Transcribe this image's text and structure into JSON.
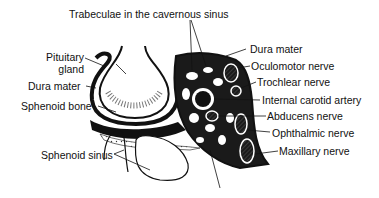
{
  "diagram": {
    "labels": {
      "trabeculae": "Trabeculae in the cavernous sinus",
      "pituitary_line1": "Pituitary",
      "pituitary_line2": "gland",
      "dura_left": "Dura mater",
      "sphenoid_bone": "Sphenoid bone",
      "sphenoid_sinus": "Sphenoid sinus",
      "dura_right": "Dura mater",
      "oculomotor": "Oculomotor nerve",
      "trochlear": "Trochlear nerve",
      "carotid": "Internal carotid artery",
      "abducens": "Abducens nerve",
      "ophthalmic": "Ophthalmic nerve",
      "maxillary": "Maxillary nerve"
    },
    "colors": {
      "ink": "#111111",
      "background": "#ffffff",
      "nerve_fill": "#bdbdbd"
    }
  }
}
